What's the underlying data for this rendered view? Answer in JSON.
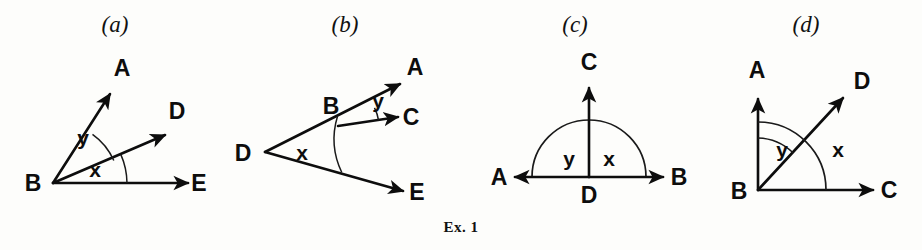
{
  "figure": {
    "caption": "Ex. 1",
    "caption_x": 0,
    "caption_y": 219,
    "width": 922,
    "height": 250,
    "ink_color": "#0d0d0d",
    "background_color": "#fdfdfb"
  },
  "panels": [
    {
      "id": "a",
      "label": "(a)",
      "left": 0,
      "width": 230,
      "vertex": "B",
      "description": "Vertex B at lower left with three rays BA, BD, BE; angle y between BA and BD, angle x between BD and BE",
      "points": [
        {
          "name": "B",
          "label": "B",
          "x": 53,
          "y": 183,
          "label_x": 33,
          "label_y": 191
        },
        {
          "name": "A",
          "label": "A",
          "x": 112,
          "y": 92,
          "label_x": 122,
          "label_y": 76
        },
        {
          "name": "D",
          "label": "D",
          "x": 167,
          "y": 133,
          "label_x": 177,
          "label_y": 119
        },
        {
          "name": "E",
          "label": "E",
          "x": 190,
          "y": 183,
          "label_x": 199,
          "label_y": 191
        }
      ],
      "angles": [
        {
          "name": "y",
          "label": "y",
          "label_x": 83,
          "label_y": 145
        },
        {
          "name": "x",
          "label": "x",
          "label_x": 95,
          "label_y": 177
        }
      ]
    },
    {
      "id": "b",
      "label": "(b)",
      "left": 230,
      "width": 230,
      "vertex": "D",
      "description": "Vertex D at left with rays DA and DE; point B lies on ray DA; ray BC from B; angle x at D, angle y between BA and BC",
      "points": [
        {
          "name": "D",
          "label": "D",
          "x": 265,
          "y": 152,
          "label_x": 243,
          "label_y": 161
        },
        {
          "name": "B",
          "label": "B",
          "x": 338,
          "y": 126,
          "label_x": 331,
          "label_y": 114
        },
        {
          "name": "A",
          "label": "A",
          "x": 402,
          "y": 82,
          "label_x": 415,
          "label_y": 75
        },
        {
          "name": "C",
          "label": "C",
          "x": 400,
          "y": 116,
          "label_x": 411,
          "label_y": 125
        },
        {
          "name": "E",
          "label": "E",
          "x": 405,
          "y": 192,
          "label_x": 417,
          "label_y": 200
        }
      ],
      "angles": [
        {
          "name": "x",
          "label": "x",
          "label_x": 302,
          "label_y": 160
        },
        {
          "name": "y",
          "label": "y",
          "label_x": 378,
          "label_y": 108
        }
      ]
    },
    {
      "id": "c",
      "label": "(c)",
      "left": 460,
      "width": 230,
      "vertex": "D",
      "description": "Straight line A to B through center D with ray DC vertical; semicircle arc above; angle y on left of DC, angle x on right of DC",
      "points": [
        {
          "name": "D",
          "label": "D",
          "x": 589,
          "y": 177,
          "label_x": 589,
          "label_y": 203
        },
        {
          "name": "C",
          "label": "C",
          "x": 589,
          "y": 86,
          "label_x": 589,
          "label_y": 70
        },
        {
          "name": "A",
          "label": "A",
          "x": 513,
          "y": 177,
          "label_x": 499,
          "label_y": 185
        },
        {
          "name": "B",
          "label": "B",
          "x": 665,
          "y": 177,
          "label_x": 679,
          "label_y": 185
        }
      ],
      "angles": [
        {
          "name": "y",
          "label": "y",
          "label_x": 569,
          "label_y": 166
        },
        {
          "name": "x",
          "label": "x",
          "label_x": 609,
          "label_y": 166
        }
      ]
    },
    {
      "id": "d",
      "label": "(d)",
      "left": 690,
      "width": 232,
      "vertex": "B",
      "description": "Right angle at B with vertical ray BA and horizontal ray BC; ray BD diagonal between them; angle y between BA and BD, angle x between BD and BC",
      "points": [
        {
          "name": "B",
          "label": "B",
          "x": 758,
          "y": 190,
          "label_x": 739,
          "label_y": 199
        },
        {
          "name": "A",
          "label": "A",
          "x": 758,
          "y": 97,
          "label_x": 757,
          "label_y": 78
        },
        {
          "name": "D",
          "label": "D",
          "x": 845,
          "y": 96,
          "label_x": 862,
          "label_y": 89
        },
        {
          "name": "C",
          "label": "C",
          "x": 875,
          "y": 190,
          "label_x": 889,
          "label_y": 198
        }
      ],
      "angles": [
        {
          "name": "y",
          "label": "y",
          "label_x": 782,
          "label_y": 157
        },
        {
          "name": "x",
          "label": "x",
          "label_x": 838,
          "label_y": 157
        }
      ]
    }
  ]
}
